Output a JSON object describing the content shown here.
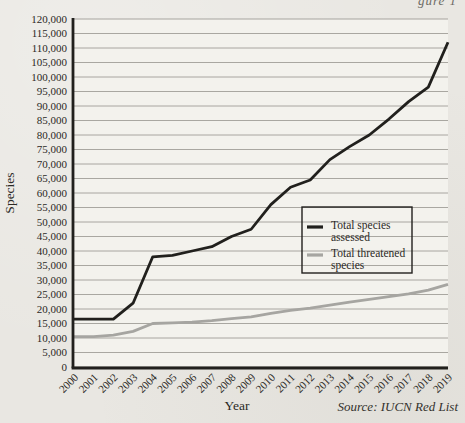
{
  "page": {
    "cropped_header_fragment": "gure 1"
  },
  "chart_data": {
    "type": "line",
    "title": "",
    "xlabel": "Year",
    "ylabel": "Species",
    "source_note": "Source: IUCN Red List",
    "x": [
      "2000",
      "2001",
      "2002",
      "2003",
      "2004",
      "2005",
      "2006",
      "2007",
      "2008",
      "2009",
      "2010",
      "2011",
      "2012",
      "2013",
      "2014",
      "2015",
      "2016",
      "2017",
      "2018",
      "2019"
    ],
    "ylim": [
      0,
      120000
    ],
    "ytick_step": 5000,
    "grid": true,
    "legend_position": "middle-right",
    "series": [
      {
        "name": "Total species assessed",
        "legend_lines": [
          "Total species",
          "assessed"
        ],
        "color": "#21201d",
        "values": [
          16500,
          16500,
          16500,
          22000,
          38000,
          38500,
          40000,
          41500,
          45000,
          47500,
          56000,
          62000,
          64500,
          71500,
          76000,
          80000,
          85500,
          91500,
          96500,
          112000
        ]
      },
      {
        "name": "Total threatened species",
        "legend_lines": [
          "Total threatened",
          "species"
        ],
        "color": "#a6a5a1",
        "values": [
          10500,
          10500,
          11000,
          12300,
          15000,
          15200,
          15500,
          16000,
          16700,
          17300,
          18500,
          19500,
          20300,
          21300,
          22400,
          23300,
          24300,
          25200,
          26500,
          28500
        ]
      }
    ],
    "colors": {
      "axis": "#21201d",
      "grid": "#95938d",
      "plot_bg": "#f3f2ed",
      "text": "#2b2925",
      "legend_border": "#21201d"
    }
  }
}
